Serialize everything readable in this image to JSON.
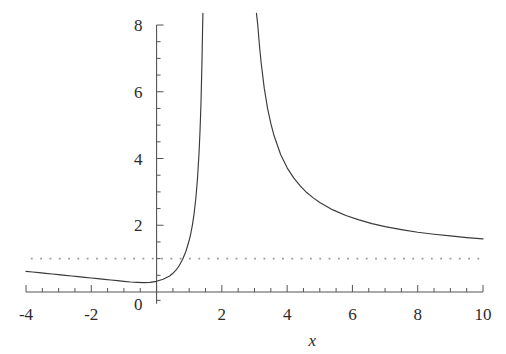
{
  "chart_data": {
    "type": "line",
    "title": "",
    "subtitle": "",
    "xlabel": "x",
    "ylabel": "",
    "xlim": [
      -4,
      10
    ],
    "ylim": [
      -0.35,
      8.35
    ],
    "grid": false,
    "legend_position": "none",
    "x_ticks_major": [
      -4,
      -2,
      0,
      2,
      4,
      6,
      8,
      10
    ],
    "x_tick_labels": [
      "-4",
      "-2",
      "0",
      "2",
      "4",
      "6",
      "8",
      "10"
    ],
    "x_minor_tick_step": 0.5,
    "y_ticks_major": [
      0,
      2,
      4,
      6,
      8
    ],
    "y_tick_labels": [
      "0",
      "2",
      "4",
      "6",
      "8"
    ],
    "y_minor_tick_step": 0.5,
    "curve_color": "#3a3a3a",
    "asymptote_color": "#9a9a9a",
    "axis_color": "#555555",
    "annotations": [
      {
        "kind": "horizontal-asymptote",
        "value": 1,
        "style": "dotted",
        "label": ""
      },
      {
        "kind": "vertical-asymptote",
        "value": 1.6,
        "style": "implied",
        "label": ""
      }
    ],
    "series": [
      {
        "name": "left-branch",
        "points": [
          [
            -4.0,
            0.62
          ],
          [
            -3.8,
            0.6
          ],
          [
            -3.6,
            0.58
          ],
          [
            -3.4,
            0.56
          ],
          [
            -3.2,
            0.54
          ],
          [
            -3.0,
            0.52
          ],
          [
            -2.8,
            0.5
          ],
          [
            -2.6,
            0.48
          ],
          [
            -2.4,
            0.46
          ],
          [
            -2.2,
            0.44
          ],
          [
            -2.0,
            0.42
          ],
          [
            -1.8,
            0.4
          ],
          [
            -1.6,
            0.38
          ],
          [
            -1.4,
            0.36
          ],
          [
            -1.2,
            0.34
          ],
          [
            -1.0,
            0.32
          ],
          [
            -0.8,
            0.3
          ],
          [
            -0.6,
            0.29
          ],
          [
            -0.4,
            0.28
          ],
          [
            -0.2,
            0.29
          ],
          [
            0.0,
            0.32
          ],
          [
            0.2,
            0.38
          ],
          [
            0.4,
            0.48
          ],
          [
            0.5,
            0.56
          ],
          [
            0.6,
            0.66
          ],
          [
            0.7,
            0.8
          ],
          [
            0.8,
            0.98
          ],
          [
            0.9,
            1.22
          ],
          [
            1.0,
            1.55
          ],
          [
            1.05,
            1.76
          ],
          [
            1.1,
            2.02
          ],
          [
            1.15,
            2.35
          ],
          [
            1.2,
            2.78
          ],
          [
            1.25,
            3.35
          ],
          [
            1.3,
            4.15
          ],
          [
            1.33,
            4.8
          ],
          [
            1.36,
            5.65
          ],
          [
            1.39,
            6.85
          ],
          [
            1.41,
            7.9
          ],
          [
            1.42,
            8.35
          ]
        ]
      },
      {
        "name": "right-branch",
        "points": [
          [
            3.06,
            8.35
          ],
          [
            3.1,
            8.0
          ],
          [
            3.15,
            7.4
          ],
          [
            3.2,
            6.9
          ],
          [
            3.3,
            6.1
          ],
          [
            3.4,
            5.5
          ],
          [
            3.5,
            5.05
          ],
          [
            3.6,
            4.68
          ],
          [
            3.8,
            4.12
          ],
          [
            4.0,
            3.72
          ],
          [
            4.2,
            3.42
          ],
          [
            4.4,
            3.18
          ],
          [
            4.6,
            2.98
          ],
          [
            4.8,
            2.82
          ],
          [
            5.0,
            2.68
          ],
          [
            5.4,
            2.46
          ],
          [
            5.8,
            2.29
          ],
          [
            6.2,
            2.16
          ],
          [
            6.6,
            2.05
          ],
          [
            7.0,
            1.96
          ],
          [
            7.5,
            1.87
          ],
          [
            8.0,
            1.79
          ],
          [
            8.5,
            1.73
          ],
          [
            9.0,
            1.68
          ],
          [
            9.5,
            1.63
          ],
          [
            10.0,
            1.59
          ]
        ]
      }
    ],
    "asymptote_line": {
      "y": 1,
      "x_start": -3.85,
      "x_end": 9.95,
      "dot_spacing_units": 0.285
    }
  }
}
